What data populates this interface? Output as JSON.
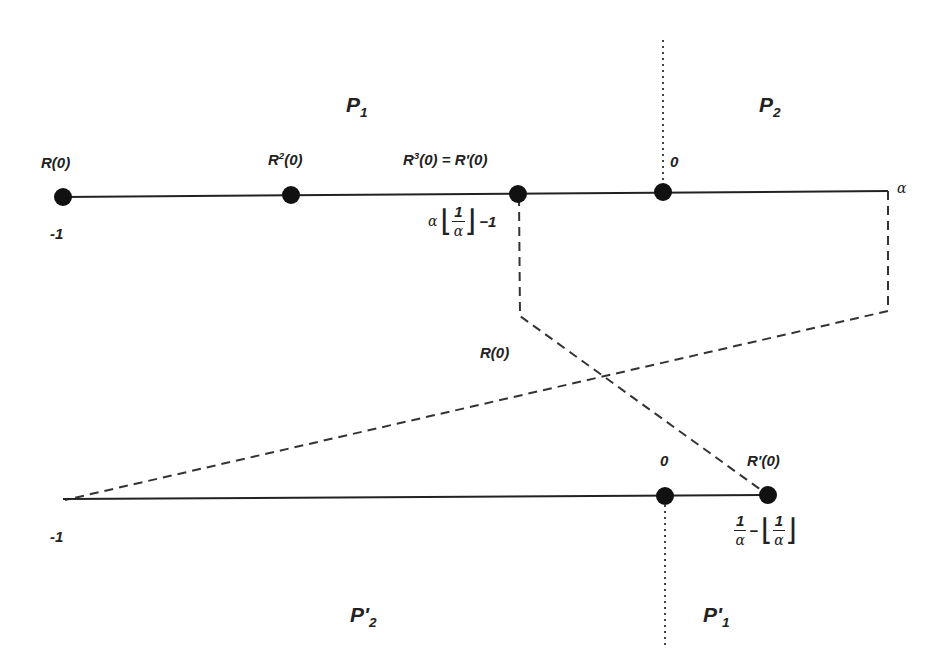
{
  "regions": {
    "top_left": "P",
    "top_left_sub": "1",
    "top_right": "P",
    "top_right_sub": "2",
    "bottom_left": "P'",
    "bottom_left_sub": "2",
    "bottom_right": "P'",
    "bottom_right_sub": "1"
  },
  "top_line": {
    "points": [
      {
        "label": "R(0)",
        "value": "-1",
        "x": 63
      },
      {
        "label_base": "R",
        "label_sup": "2",
        "label_tail": "(0)",
        "x": 291
      },
      {
        "label_base": "R",
        "label_sup": "3",
        "label_tail": "(0) = R'(0)",
        "x": 518,
        "value_expr": "α⌊1/α⌋ − 1"
      },
      {
        "label": "0",
        "x": 663
      }
    ],
    "end_label": "α"
  },
  "middle_label": "R(0)",
  "bottom_line": {
    "start_label": "-1",
    "points": [
      {
        "label": "0",
        "x": 665
      },
      {
        "label": "R'(0)",
        "x": 768,
        "value_expr": "1/α − ⌊1/α⌋"
      }
    ]
  },
  "math": {
    "alpha": "α",
    "one": "1",
    "minus_one": "−1",
    "minus": "−",
    "lfloor": "⌊",
    "rfloor": "⌋"
  },
  "colors": {
    "line": "#222222",
    "dot": "#111111",
    "dashed": "#333333"
  }
}
